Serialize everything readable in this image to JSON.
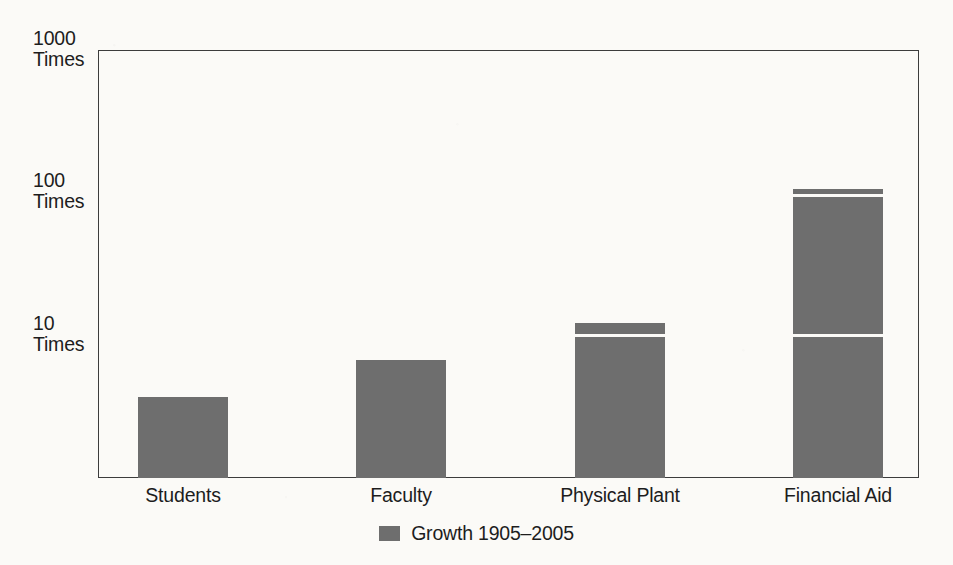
{
  "chart_data": {
    "type": "bar",
    "title": "",
    "subtitle": "",
    "xlabel": "",
    "ylabel": "",
    "categories": [
      "Students",
      "Faculty",
      "Physical Plant",
      "Financial Aid"
    ],
    "values": [
      3.7,
      6.7,
      12,
      105
    ],
    "series": [
      {
        "name": "Growth 1905–2005",
        "values": [
          3.7,
          6.7,
          12,
          105
        ]
      }
    ],
    "yscale": "log",
    "ylim": [
      1,
      1000
    ],
    "yticks": [
      10,
      100,
      1000
    ],
    "ytick_labels": [
      "10 Times",
      "100 Times",
      "1000 Times"
    ],
    "grid": false,
    "legend_position": "bottom-center",
    "bar_color": "#6e6e6e",
    "axis_color": "#3c3c3c",
    "background_color": "#fbfaf7"
  },
  "axis": {
    "y_ticks": [
      {
        "num": "1000",
        "unit": "Times"
      },
      {
        "num": "100",
        "unit": "Times"
      },
      {
        "num": "10",
        "unit": "Times"
      }
    ],
    "x_categories": [
      "Students",
      "Faculty",
      "Physical Plant",
      "Financial Aid"
    ]
  },
  "legend": {
    "items": [
      {
        "label": "Growth 1905–2005",
        "color": "#6e6e6e"
      }
    ]
  }
}
